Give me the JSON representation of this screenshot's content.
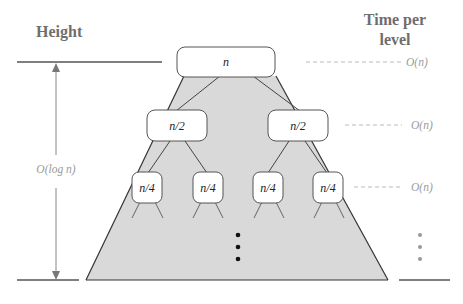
{
  "headers": {
    "height": "Height",
    "time_line1": "Time per",
    "time_line2": "level"
  },
  "height_label": "O(log n)",
  "tree": {
    "root": "n",
    "level1": [
      "n/2",
      "n/2"
    ],
    "level2": [
      "n/4",
      "n/4",
      "n/4",
      "n/4"
    ]
  },
  "level_costs": [
    "O(n)",
    "O(n)",
    "O(n)"
  ],
  "colors": {
    "triangle_fill": "#d9d9d9",
    "line": "#333333",
    "label_gray": "#9a9a9a",
    "header_gray": "#6e6e6e"
  }
}
